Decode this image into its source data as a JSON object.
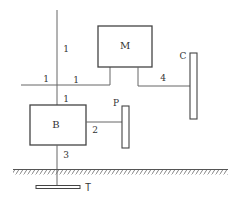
{
  "diagram": {
    "colors": {
      "stroke": "#555555",
      "text": "#333333",
      "background": "#ffffff"
    },
    "blocks": {
      "M": {
        "label": "M"
      },
      "B": {
        "label": "B"
      }
    },
    "bars": {
      "C": {
        "label": "C"
      },
      "P": {
        "label": "P"
      },
      "T": {
        "label": "T"
      }
    },
    "connections": {
      "vertical_top": {
        "label": "1"
      },
      "horizontal_left": {
        "label": "1"
      },
      "horizontal_right": {
        "label": "1"
      },
      "vertical_mid": {
        "label": "1"
      },
      "m_to_c": {
        "label": "4"
      },
      "b_to_p": {
        "label": "2"
      },
      "b_to_t": {
        "label": "3"
      }
    },
    "ground": {
      "label": "ground"
    }
  }
}
